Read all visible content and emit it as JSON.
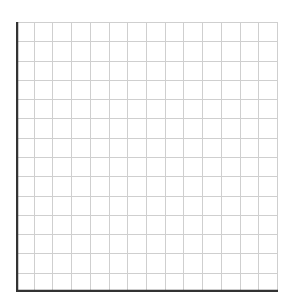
{
  "chart_data": {
    "type": "line",
    "title": "",
    "xlabel": "",
    "ylabel": "",
    "series": [],
    "grid": true,
    "grid_columns": 14,
    "grid_rows": 14,
    "xlim": [
      0,
      14
    ],
    "ylim": [
      0,
      14
    ],
    "legend": "none",
    "note": "Empty grid with no plotted data"
  },
  "colors": {
    "grid": "#cfcfcf",
    "axis": "#333333",
    "background": "#ffffff"
  }
}
